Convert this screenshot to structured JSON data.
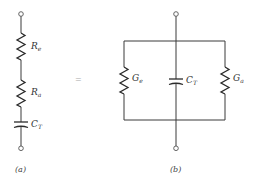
{
  "diagram": {
    "type": "equivalent-circuit",
    "equals_symbol": "=",
    "circuit_a": {
      "caption": "(a)",
      "topology": "series",
      "components": [
        {
          "kind": "resistor",
          "symbol": "R",
          "subscript": "e"
        },
        {
          "kind": "resistor",
          "symbol": "R",
          "subscript": "a"
        },
        {
          "kind": "capacitor",
          "symbol": "C",
          "subscript": "T"
        }
      ]
    },
    "circuit_b": {
      "caption": "(b)",
      "topology": "parallel",
      "components": [
        {
          "kind": "resistor",
          "symbol": "G",
          "subscript": "e"
        },
        {
          "kind": "capacitor",
          "symbol": "C",
          "subscript": "T"
        },
        {
          "kind": "resistor",
          "symbol": "G",
          "subscript": "a"
        }
      ]
    }
  }
}
